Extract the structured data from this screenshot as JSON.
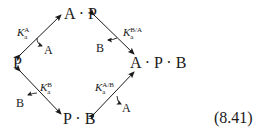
{
  "nodes": {
    "top": "A · P",
    "left": "P",
    "right": "A · P · B",
    "bottom": "P · B"
  },
  "constants": {
    "top_left": {
      "main": "K",
      "sup": "A",
      "sub": "a"
    },
    "top_right": {
      "main": "K",
      "sup": "B/A",
      "sub": "a"
    },
    "bottom_left": {
      "main": "K",
      "sup": "B",
      "sub": "a"
    },
    "bottom_right": {
      "main": "K",
      "sup": "A/B",
      "sub": "a"
    }
  },
  "released_species": {
    "top_left": "A",
    "top_right": "B",
    "bottom_left": "B",
    "bottom_right": "A"
  },
  "equation_number": "(8.41)",
  "colors": {
    "ink": "#1a1a1a",
    "background": "#ffffff"
  }
}
